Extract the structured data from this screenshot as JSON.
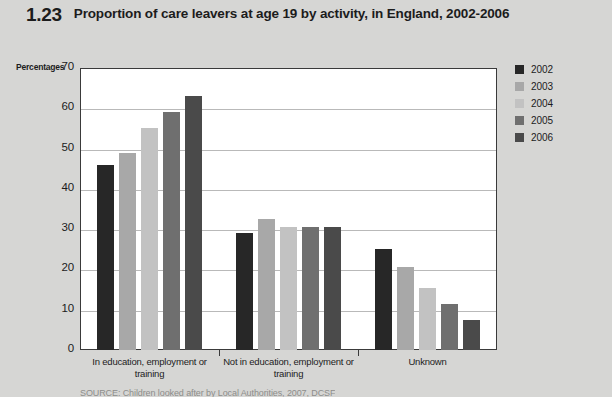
{
  "figure": {
    "number": "1.23",
    "title": "Proportion of care leavers at age 19 by activity, in England, 2002-2006"
  },
  "source": {
    "text": "SOURCE: Children looked after by Local Authorities, 2007, DCSF"
  },
  "chart_data": {
    "type": "bar",
    "title": "Proportion of care leavers at age 19 by activity, in England, 2002-2006",
    "xlabel": "",
    "ylabel": "Percentages",
    "ylim": [
      0,
      70
    ],
    "yticks": [
      0,
      10,
      20,
      30,
      40,
      50,
      60,
      70
    ],
    "grid": true,
    "legend_position": "right",
    "categories": [
      "In education, employment or training",
      "Not in education, employment or training",
      "Unknown"
    ],
    "series": [
      {
        "name": "2002",
        "color": "#272727",
        "values": [
          46,
          29,
          25
        ]
      },
      {
        "name": "2003",
        "color": "#a8a8a8",
        "values": [
          49,
          32.5,
          20.5
        ]
      },
      {
        "name": "2004",
        "color": "#c2c2c2",
        "values": [
          55,
          30.5,
          15.5
        ]
      },
      {
        "name": "2005",
        "color": "#6f6f6f",
        "values": [
          59,
          30.5,
          11.5
        ]
      },
      {
        "name": "2006",
        "color": "#4a4a4a",
        "values": [
          63,
          30.5,
          7.5
        ]
      }
    ]
  }
}
